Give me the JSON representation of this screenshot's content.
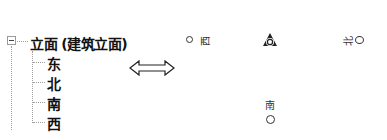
{
  "tree": {
    "root": {
      "label": "立面 (建筑立面)",
      "expanded": true,
      "expander_icon": "minus-box-icon"
    },
    "children": [
      {
        "label": "东"
      },
      {
        "label": "北"
      },
      {
        "label": "南"
      },
      {
        "label": "西"
      }
    ]
  },
  "arrow": {
    "icon": "double-headed-arrow-icon"
  },
  "elevation_markers": {
    "west": {
      "label": "西",
      "icon": "elevation-marker-circle-icon"
    },
    "center": {
      "icon": "elevation-center-symbol-icon"
    },
    "east": {
      "label": "北",
      "icon": "elevation-marker-circle-icon"
    },
    "south": {
      "label": "南",
      "icon": "elevation-marker-circle-icon"
    }
  },
  "colors": {
    "text": "#111111",
    "tree_lines": "#a0a0a0",
    "background": "#ffffff"
  }
}
